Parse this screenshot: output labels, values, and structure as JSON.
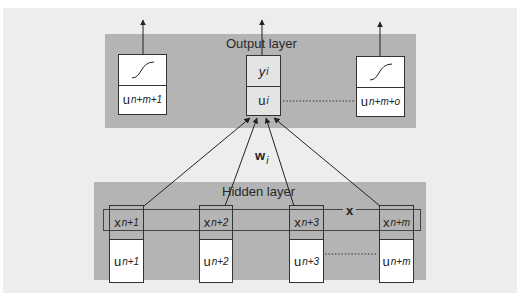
{
  "output_layer": {
    "label": "Output layer",
    "units": [
      {
        "id": "left",
        "top_glyph": "sigmoid",
        "bottom_main": "u",
        "bottom_sub": "n+m+1"
      },
      {
        "id": "selected",
        "top_main": "y",
        "top_sub": "i",
        "bottom_main": "u",
        "bottom_sub": "i"
      },
      {
        "id": "right",
        "top_glyph": "sigmoid",
        "bottom_main": "u",
        "bottom_sub": "n+m+o"
      }
    ]
  },
  "hidden_layer": {
    "label": "Hidden layer",
    "units": [
      {
        "top_main": "x",
        "top_sub": "n+1",
        "bottom_main": "u",
        "bottom_sub": "n+1"
      },
      {
        "top_main": "x",
        "top_sub": "n+2",
        "bottom_main": "u",
        "bottom_sub": "n+2"
      },
      {
        "top_main": "x",
        "top_sub": "n+3",
        "bottom_main": "u",
        "bottom_sub": "n+3"
      },
      {
        "top_main": "x",
        "top_sub": "n+m",
        "bottom_main": "u",
        "bottom_sub": "n+m"
      }
    ],
    "vector_label": "x"
  },
  "weights": {
    "main": "w",
    "sub": "i"
  },
  "colors": {
    "canvas": "#ededed",
    "panel": "#b4b4b4",
    "box": "#ffffff",
    "selected_box": "#e4e4e4",
    "line": "#222222"
  }
}
